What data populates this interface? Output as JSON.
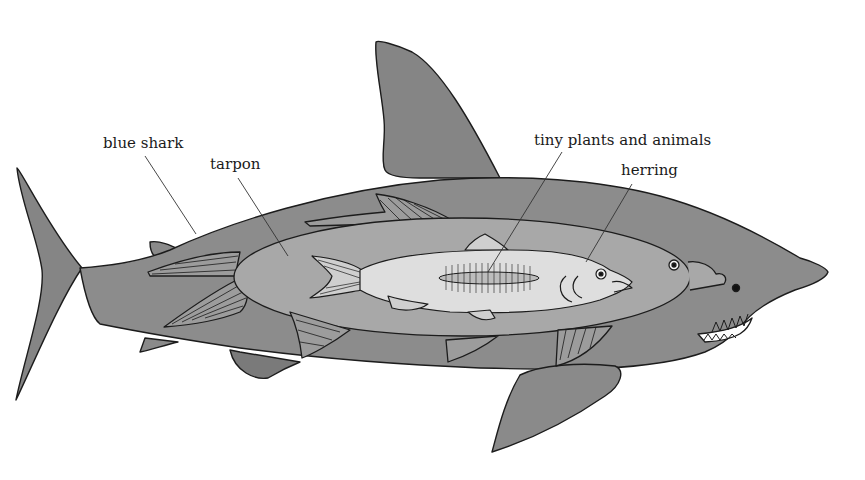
{
  "diagram": {
    "type": "food-chain-illustration",
    "labels": [
      {
        "id": "blue-shark",
        "text": "blue shark"
      },
      {
        "id": "tarpon",
        "text": "tarpon"
      },
      {
        "id": "tiny-plants-and-animals",
        "text": "tiny plants and animals"
      },
      {
        "id": "herring",
        "text": "herring"
      }
    ],
    "colors": {
      "shark": "#8a8a8a",
      "shark_dark": "#7a7a7a",
      "tarpon": "#a6a6a6",
      "herring": "#dadada",
      "plankton": "#bcbcbc",
      "outline": "#1c1c1c",
      "background": "#ffffff"
    }
  }
}
